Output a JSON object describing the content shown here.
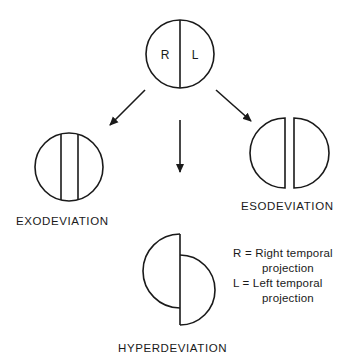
{
  "diagram": {
    "top_circle": {
      "left_label": "R",
      "right_label": "L"
    },
    "labels": {
      "exodeviation": "EXODEVIATION",
      "esodeviation": "ESODEVIATION",
      "hyperdeviation": "HYPERDEVIATION"
    },
    "legend": {
      "r_line1": "R = Right temporal",
      "r_line2": "projection",
      "l_line1": "L = Left temporal",
      "l_line2": "projection"
    },
    "colors": {
      "stroke": "#1a1a1a",
      "background": "#ffffff"
    }
  }
}
